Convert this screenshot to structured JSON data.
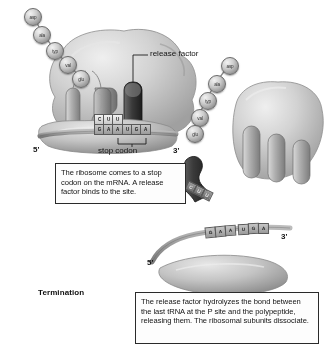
{
  "figure": {
    "stage_label": "Termination",
    "annotations": {
      "release_factor": "release factor",
      "stop_codon": "stop codon",
      "five_prime_top": "5'",
      "three_prime_top": "3'",
      "five_prime_bottom": "5'",
      "three_prime_bottom": "3'"
    },
    "captions": {
      "top": "The ribosome comes to a stop codon on the mRNA. A release factor binds to the site.",
      "bottom": "The release factor hydrolyzes the bond between the last tRNA at the P site and the polypeptide, releasing them. The ribosomal subunits dissociate."
    },
    "polypeptide_left": [
      {
        "label": "asp"
      },
      {
        "label": "ala"
      },
      {
        "label": "typ"
      },
      {
        "label": "val"
      },
      {
        "label": "glu"
      }
    ],
    "polypeptide_right": [
      {
        "label": "asp"
      },
      {
        "label": "ala"
      },
      {
        "label": "typ"
      },
      {
        "label": "val"
      },
      {
        "label": "glu"
      }
    ],
    "anticodon_bound": [
      "C",
      "U",
      "U"
    ],
    "mrna_bound": [
      "G",
      "A",
      "A",
      "U",
      "G",
      "A"
    ],
    "anticodon_released": [
      "C",
      "U",
      "U"
    ],
    "mrna_released": [
      "G",
      "A",
      "A",
      "U",
      "G",
      "A"
    ],
    "colors": {
      "release_factor": "#2b2b2b",
      "ribosome_body": "#cfcfcf",
      "trna": "#9b9b9b",
      "outline": "#2a2a2a",
      "background": "#ffffff"
    }
  }
}
